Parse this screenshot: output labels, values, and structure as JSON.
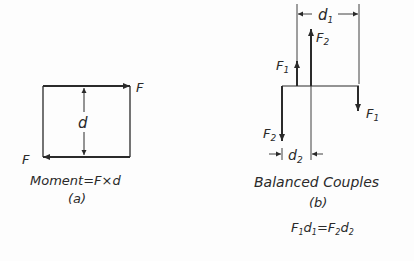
{
  "diagram_a": {
    "force_top": "F",
    "force_bottom": "F",
    "distance": "d",
    "caption": "Moment=F×d",
    "sub_caption": "(a)"
  },
  "diagram_b": {
    "dim_top": "d",
    "dim_top_sub": "1",
    "f2_up": "F",
    "f2_up_sub": "2",
    "f1_up": "F",
    "f1_up_sub": "1",
    "f1_down": "F",
    "f1_down_sub": "1",
    "f2_down": "F",
    "f2_down_sub": "2",
    "dim_bottom": "d",
    "dim_bottom_sub": "2",
    "caption": "Balanced Couples",
    "sub_caption": "(b)",
    "equation": {
      "lhs_f": "F",
      "lhs_f_sub": "1",
      "lhs_d": "d",
      "lhs_d_sub": "1",
      "eq": "=",
      "rhs_f": "F",
      "rhs_f_sub": "2",
      "rhs_d": "d",
      "rhs_d_sub": "2"
    }
  },
  "colors": {
    "ink": "#2a2a2a",
    "background": "#fdfdfd"
  }
}
